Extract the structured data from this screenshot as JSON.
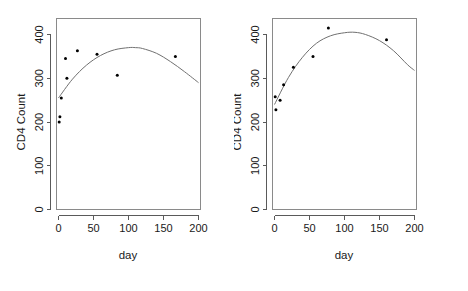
{
  "figure": {
    "background_color": "#ffffff",
    "point_color": "#000000",
    "curve_color": "#707070",
    "axis_color": "#5a5a5a",
    "frame_color": "#8a8a8a"
  },
  "chart_data": [
    {
      "type": "scatter",
      "panel": "left",
      "title": "",
      "xlabel": "day",
      "ylabel": "CD4 Count",
      "xlim": [
        0,
        200
      ],
      "ylim": [
        0,
        440
      ],
      "grid": false,
      "legend": false,
      "xticks": [
        0,
        50,
        100,
        150,
        200
      ],
      "xtick_labels": [
        "0",
        "50",
        "100",
        "150",
        "200"
      ],
      "yticks": [
        0,
        100,
        200,
        300,
        400
      ],
      "ytick_labels": [
        "0",
        "100",
        "200",
        "300",
        "400"
      ],
      "x": [
        1,
        2,
        4,
        10,
        12,
        27,
        55,
        84,
        167
      ],
      "y": [
        200,
        212,
        255,
        345,
        300,
        363,
        355,
        307,
        350
      ],
      "series": [
        {
          "name": "CD4 observations",
          "marker": "point",
          "x": [
            1,
            2,
            4,
            10,
            12,
            27,
            55,
            84,
            167
          ],
          "values": [
            200,
            212,
            255,
            345,
            300,
            363,
            355,
            307,
            350
          ]
        },
        {
          "name": "quadratic fit",
          "type": "line",
          "x": [
            0,
            20,
            40,
            60,
            80,
            100,
            110,
            120,
            140,
            160,
            180,
            200
          ],
          "values": [
            255,
            298,
            330,
            352,
            365,
            370,
            370,
            368,
            357,
            338,
            315,
            290
          ]
        }
      ]
    },
    {
      "type": "scatter",
      "panel": "right",
      "title": "",
      "xlabel": "day",
      "ylabel": "CD4 Count",
      "xlim": [
        0,
        200
      ],
      "ylim": [
        0,
        440
      ],
      "grid": false,
      "legend": false,
      "xticks": [
        0,
        50,
        100,
        150,
        200
      ],
      "xtick_labels": [
        "0",
        "50",
        "100",
        "150",
        "200"
      ],
      "yticks": [
        0,
        100,
        200,
        300,
        400
      ],
      "ytick_labels": [
        "0",
        "100",
        "200",
        "300",
        "400"
      ],
      "x": [
        1,
        2,
        8,
        13,
        27,
        55,
        77,
        160
      ],
      "y": [
        258,
        228,
        250,
        285,
        325,
        350,
        415,
        388
      ],
      "series": [
        {
          "name": "CD4 observations",
          "marker": "point",
          "x": [
            1,
            2,
            8,
            13,
            27,
            55,
            77,
            160
          ],
          "values": [
            258,
            228,
            250,
            285,
            325,
            350,
            415,
            388
          ]
        },
        {
          "name": "quadratic fit",
          "type": "line",
          "x": [
            0,
            20,
            40,
            60,
            80,
            100,
            115,
            130,
            150,
            170,
            190,
            200
          ],
          "values": [
            240,
            302,
            348,
            380,
            397,
            404,
            405,
            400,
            386,
            363,
            331,
            318
          ]
        }
      ]
    }
  ],
  "panels": {
    "left": {
      "y_axis_title": "CD4 Count",
      "x_axis_title": "day",
      "y_tick_labels": [
        "0",
        "100",
        "200",
        "300",
        "400"
      ],
      "x_tick_labels": [
        "0",
        "50",
        "100",
        "150",
        "200"
      ]
    },
    "right": {
      "y_axis_title": "CD4 Count",
      "x_axis_title": "day",
      "y_tick_labels": [
        "0",
        "100",
        "200",
        "300",
        "400"
      ],
      "x_tick_labels": [
        "0",
        "50",
        "100",
        "150",
        "200"
      ]
    }
  }
}
